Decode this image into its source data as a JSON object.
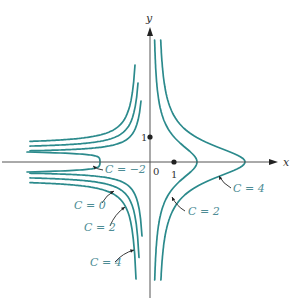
{
  "figure": {
    "colors": {
      "curve": "#2b8a8c",
      "axis": "#555555",
      "label": "#4d8c95",
      "leader": "#222222",
      "text": "#333333"
    },
    "axes": {
      "x_label": "x",
      "y_label": "y",
      "origin_label": "0",
      "x_tick_label": "1",
      "y_tick_label": "1",
      "origin_px": [
        150,
        162
      ],
      "unit_px": 25
    },
    "curve_labels": [
      {
        "text": "C = −2",
        "x": 105,
        "y": 173,
        "arrow_from": [
          103,
          170
        ],
        "arrow_to": [
          93,
          166
        ]
      },
      {
        "text": "C = 0",
        "x": 74,
        "y": 209,
        "arrow_from": [
          102,
          203
        ],
        "arrow_to": [
          114,
          191
        ]
      },
      {
        "text": "C = 2",
        "x": 84,
        "y": 231,
        "arrow_from": [
          110,
          226
        ],
        "arrow_to": [
          125,
          207
        ]
      },
      {
        "text": "C = 4",
        "x": 90,
        "y": 266,
        "arrow_from": [
          115,
          262
        ],
        "arrow_to": [
          134,
          250
        ]
      },
      {
        "text": "C = 2",
        "x": 188,
        "y": 215,
        "arrow_from": [
          185,
          211
        ],
        "arrow_to": [
          172,
          197
        ]
      },
      {
        "text": "C = 4",
        "x": 233,
        "y": 192,
        "arrow_from": [
          231,
          188
        ],
        "arrow_to": [
          219,
          176
        ]
      }
    ],
    "level_values": [
      "C = −2",
      "C = 0",
      "C = 2",
      "C = 4"
    ]
  }
}
